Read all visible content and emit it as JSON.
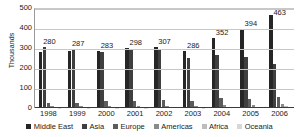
{
  "chart_data": {
    "type": "bar",
    "title": "",
    "xlabel": "",
    "ylabel": "Thousands",
    "ylim": [
      0,
      500
    ],
    "yticks": [
      0,
      100,
      200,
      300,
      400,
      500
    ],
    "grid": true,
    "legend_position": "bottom",
    "categories": [
      "1998",
      "1999",
      "2000",
      "2001",
      "2002",
      "2003",
      "2004",
      "2005",
      "2006"
    ],
    "series": [
      {
        "name": "Middle East",
        "color": "#262626",
        "values": [
          280,
          287,
          283,
          298,
          307,
          286,
          352,
          394,
          463
        ]
      },
      {
        "name": "Asia",
        "color": "#3f3f3f",
        "values": [
          306,
          297,
          281,
          288,
          294,
          250,
          264,
          256,
          219
        ]
      },
      {
        "name": "Europe",
        "color": "#5c5c5c",
        "values": [
          26,
          26,
          33,
          37,
          39,
          33,
          50,
          45,
          55
        ]
      },
      {
        "name": "Americas",
        "color": "#8a8a8a",
        "values": [
          9,
          9,
          10,
          12,
          12,
          11,
          15,
          16,
          21
        ]
      },
      {
        "name": "Africa",
        "color": "#bdbdbd",
        "values": [
          4,
          4,
          5,
          5,
          6,
          5,
          7,
          7,
          9
        ]
      },
      {
        "name": "Oceania",
        "color": "#d8d8d8",
        "values": [
          2,
          2,
          2,
          2,
          3,
          2,
          3,
          3,
          4
        ]
      }
    ],
    "data_labels": {
      "series": "Middle East",
      "values": [
        "280",
        "287",
        "283",
        "298",
        "307",
        "286",
        "352",
        "394",
        "463"
      ]
    }
  }
}
